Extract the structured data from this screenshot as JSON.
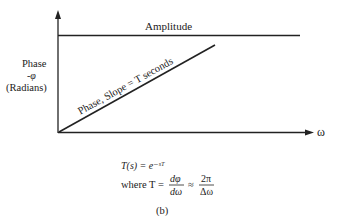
{
  "diagram": {
    "curves": {
      "amplitude_label": "Amplitude",
      "phase_label": "Phase, Slope = T seconds"
    },
    "y_axis": {
      "label_line1": "Phase",
      "label_line2": "-φ",
      "label_line3": "(Radians)"
    },
    "x_axis": {
      "label": "ω"
    },
    "equations": {
      "transfer": "T(s) = e⁻ˢᵀ",
      "where_prefix": "where T =",
      "frac1_num": "dφ",
      "frac1_den": "dω",
      "approx": "≈",
      "frac2_num": "2π",
      "frac2_den": "Δω"
    },
    "caption": "(b)"
  }
}
